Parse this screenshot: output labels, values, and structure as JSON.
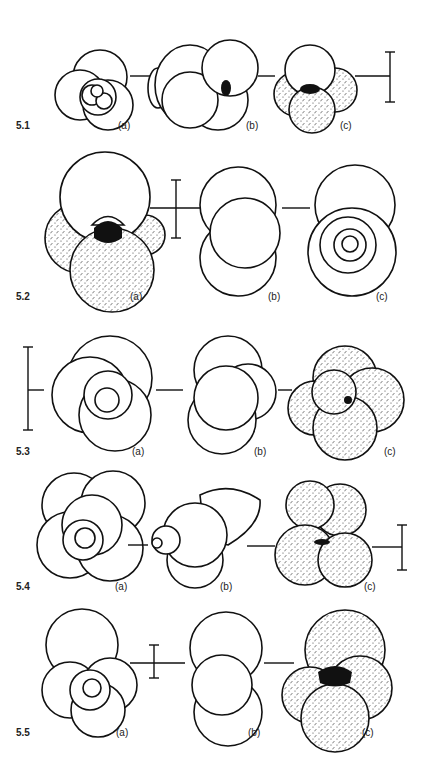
{
  "figure": {
    "rows": [
      {
        "id": "5.1",
        "views": [
          "(a)",
          "(b)",
          "(c)"
        ]
      },
      {
        "id": "5.2",
        "views": [
          "(a)",
          "(b)",
          "(c)"
        ]
      },
      {
        "id": "5.3",
        "views": [
          "(a)",
          "(b)",
          "(c)"
        ]
      },
      {
        "id": "5.4",
        "views": [
          "(a)",
          "(b)",
          "(c)"
        ]
      },
      {
        "id": "5.5",
        "views": [
          "(a)",
          "(b)",
          "(c)"
        ]
      }
    ],
    "view_meaning": {
      "a": "spiral view",
      "b": "edge view",
      "c": "umbilical view"
    },
    "elements": {
      "scale_bar": "vertical scale bar",
      "connector": "horizontal linking line between views"
    },
    "colors": {
      "ink": "#111111",
      "paper": "#ffffff"
    }
  }
}
